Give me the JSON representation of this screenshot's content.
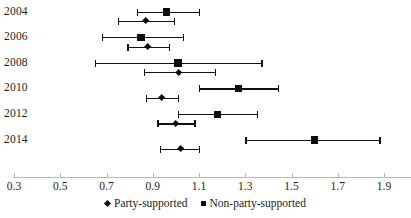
{
  "chart_data": {
    "type": "scatter",
    "title": "",
    "subtitle": "",
    "xlabel": "",
    "ylabel": "",
    "orientation": "horizontal",
    "grid": false,
    "legend_position": "bottom-center",
    "xlim": [
      0.3,
      1.9
    ],
    "xticks": [
      0.3,
      0.5,
      0.7,
      0.9,
      1.1,
      1.3,
      1.5,
      1.7,
      1.9
    ],
    "xtick_labels": [
      "0.3",
      "0.5",
      "0.7",
      "0.9",
      "1.1",
      "1.3",
      "1.5",
      "1.7",
      "1.9"
    ],
    "categories": [
      "2004",
      "2006",
      "2008",
      "2010",
      "2012",
      "2014"
    ],
    "series": [
      {
        "name": "Party-supported",
        "marker": "diamond",
        "color": "#0d0d0d",
        "values": [
          0.87,
          0.88,
          1.01,
          0.94,
          1.0,
          1.02
        ],
        "ci_low": [
          0.75,
          0.79,
          0.86,
          0.87,
          0.92,
          0.93
        ],
        "ci_high": [
          0.99,
          0.97,
          1.17,
          1.01,
          1.08,
          1.1
        ]
      },
      {
        "name": "Non-party-supported",
        "marker": "square",
        "color": "#0d0d0d",
        "values": [
          0.96,
          0.85,
          1.01,
          1.27,
          1.18,
          1.6
        ],
        "ci_low": [
          0.83,
          0.68,
          0.65,
          1.1,
          1.01,
          1.3
        ],
        "ci_high": [
          1.1,
          1.03,
          1.37,
          1.44,
          1.35,
          1.88
        ]
      }
    ],
    "legend": [
      {
        "label": "Party-supported",
        "marker": "diamond"
      },
      {
        "label": "Non-party-supported",
        "marker": "square"
      }
    ]
  },
  "axis": {
    "line_color": "#b9b9b9"
  }
}
